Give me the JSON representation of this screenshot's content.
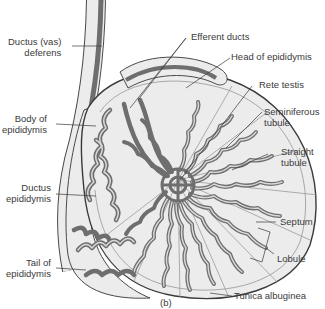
{
  "figure": {
    "panel_label": "(b)",
    "colors": {
      "background": "#ffffff",
      "tissue_fill": "#ececec",
      "tubule": "#6e6e6e",
      "tubule_lumen": "#d9d9d9",
      "outline": "#4a4a4a",
      "label_text": "#3a3a3a"
    }
  },
  "labels": {
    "ductus_deferens": {
      "line1": "Ductus (vas)",
      "line2": "deferens"
    },
    "body_epididymis": {
      "line1": "Body of",
      "line2": "epididymis"
    },
    "ductus_epididymis": {
      "line1": "Ductus",
      "line2": "epididymis"
    },
    "tail_epididymis": {
      "line1": "Tail of",
      "line2": "epididymis"
    },
    "efferent_ducts": {
      "line1": "Efferent ducts"
    },
    "head_epididymis": {
      "line1": "Head of epididymis"
    },
    "rete_testis": {
      "line1": "Rete testis"
    },
    "seminiferous_tubule": {
      "line1": "Seminiferous",
      "line2": "tubule"
    },
    "straight_tubule": {
      "line1": "Straight",
      "line2": "tubule"
    },
    "septum": {
      "line1": "Septum"
    },
    "lobule": {
      "line1": "Lobule"
    },
    "tunica_albuginea": {
      "line1": "Tunica albuginea"
    }
  }
}
